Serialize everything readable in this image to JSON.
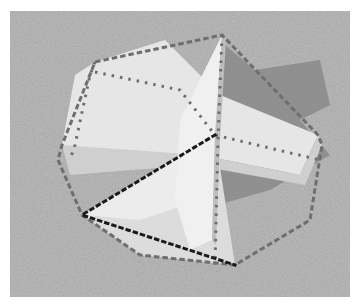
{
  "image": {
    "description": "Grayscale photo of intersecting wooden boards on grass with dotted outline overlays",
    "background_color": "#ffffff",
    "grass_color": "#a6a6a6",
    "shadow_color": "#8c8c8c",
    "board_light_color": "#ececec",
    "board_mid_color": "#d2d2d2",
    "dot_dark_color": "#1a1a1a",
    "dot_gray_color": "#6e6e6e"
  }
}
